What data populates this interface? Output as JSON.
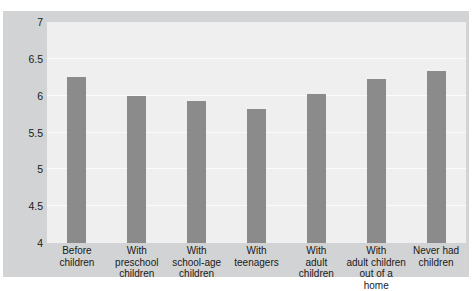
{
  "figure": {
    "clipped_header_text": "",
    "background_color": "#ffffff",
    "frame_color": "#d2d3d4",
    "plot_background_color": "#efefef",
    "bar_color": "#8b8b8b",
    "gridline_color": "#fbfbfb"
  },
  "chart_data": {
    "type": "bar",
    "title": "",
    "xlabel": "",
    "ylabel": "",
    "ylim": [
      4,
      7
    ],
    "yticks": [
      4,
      4.5,
      5,
      5.5,
      6,
      6.5,
      7
    ],
    "ytick_labels": [
      "4",
      "4.5",
      "5",
      "5.5",
      "6",
      "6.5",
      "7"
    ],
    "grid": true,
    "legend": false,
    "categories": [
      "Before children",
      "With preschool children",
      "With school-age children",
      "With teenagers",
      "With adult children",
      "With adult children out of a home",
      "Never had children"
    ],
    "category_lines": [
      [
        "Before",
        "children"
      ],
      [
        "With",
        "preschool",
        "children"
      ],
      [
        "With",
        "school-age",
        "children"
      ],
      [
        "With",
        "teenagers"
      ],
      [
        "With",
        "adult",
        "children"
      ],
      [
        "With",
        "adult children",
        "out of a home"
      ],
      [
        "Never had",
        "children"
      ]
    ],
    "values": [
      6.26,
      5.99,
      5.93,
      5.82,
      6.02,
      6.23,
      6.34
    ]
  }
}
